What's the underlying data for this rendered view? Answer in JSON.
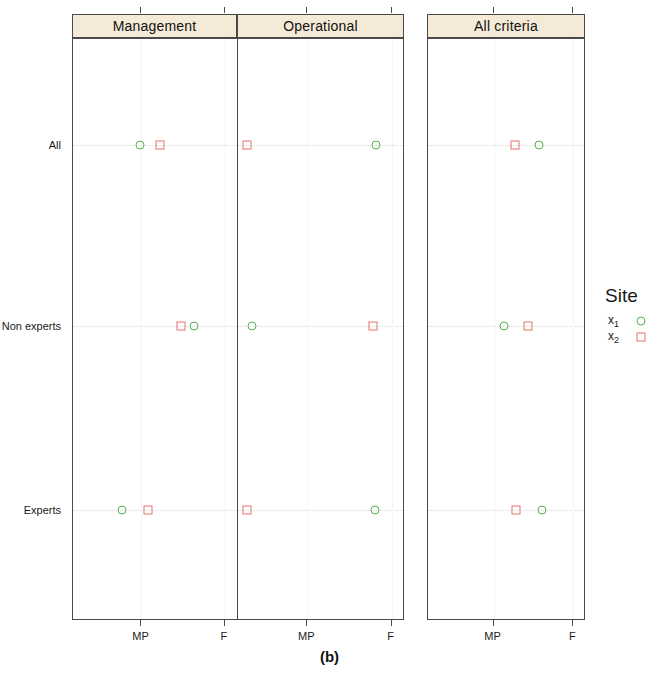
{
  "figure": {
    "caption": "(b)",
    "background": "#ffffff",
    "strip_fill": "#f5ead8",
    "frame_color": "#4a4a4a"
  },
  "legend": {
    "title": "Site",
    "position": "right",
    "entries": [
      {
        "label": "x",
        "sub": "1",
        "marker": "circle",
        "color": "#56b356"
      },
      {
        "label": "x",
        "sub": "2",
        "marker": "square",
        "color": "#e8726a"
      }
    ]
  },
  "chart_data": {
    "type": "scatter",
    "title": "(b)",
    "xlabel": "",
    "ylabel": "",
    "grid": true,
    "legend_position": "right",
    "legend_title": "Site",
    "facets": [
      "Management",
      "Operational",
      "All criteria"
    ],
    "categories": [
      "All",
      "Non experts",
      "Experts"
    ],
    "xticks": [
      "MP",
      "F"
    ],
    "xtick_values": [
      1,
      2
    ],
    "xlim": [
      0.5,
      2.5
    ],
    "series": [
      {
        "name": "x1",
        "marker": "circle",
        "color": "#56b356",
        "points": [
          {
            "facet": "Management",
            "category": "All",
            "x": 1.32
          },
          {
            "facet": "Management",
            "category": "Non experts",
            "x": 1.98
          },
          {
            "facet": "Management",
            "category": "Experts",
            "x": 1.1
          },
          {
            "facet": "Operational",
            "category": "All",
            "x": 2.17
          },
          {
            "facet": "Operational",
            "category": "Non experts",
            "x": 0.68
          },
          {
            "facet": "Operational",
            "category": "Experts",
            "x": 2.15
          },
          {
            "facet": "All criteria",
            "category": "All",
            "x": 1.92
          },
          {
            "facet": "All criteria",
            "category": "Non experts",
            "x": 1.48
          },
          {
            "facet": "All criteria",
            "category": "Experts",
            "x": 1.95
          }
        ]
      },
      {
        "name": "x2",
        "marker": "square",
        "color": "#e8726a",
        "points": [
          {
            "facet": "Management",
            "category": "All",
            "x": 1.57
          },
          {
            "facet": "Management",
            "category": "Non experts",
            "x": 1.82
          },
          {
            "facet": "Management",
            "category": "Experts",
            "x": 1.42
          },
          {
            "facet": "Operational",
            "category": "All",
            "x": 0.62
          },
          {
            "facet": "Operational",
            "category": "Non experts",
            "x": 2.13
          },
          {
            "facet": "Operational",
            "category": "Experts",
            "x": 0.62
          },
          {
            "facet": "All criteria",
            "category": "All",
            "x": 1.61
          },
          {
            "facet": "All criteria",
            "category": "Non experts",
            "x": 1.78
          },
          {
            "facet": "All criteria",
            "category": "Experts",
            "x": 1.63
          }
        ]
      }
    ]
  },
  "geometry": {
    "strip_top": 14,
    "strip_height": 24,
    "body_top": 38,
    "body_bottom": 620,
    "panels": [
      {
        "name": "Management",
        "left": 72,
        "right": 237
      },
      {
        "name": "Operational",
        "left": 237,
        "right": 404
      },
      {
        "name": "All criteria",
        "left": 427,
        "right": 585
      }
    ],
    "rows": [
      {
        "name": "All",
        "y": 145
      },
      {
        "name": "Non experts",
        "y": 326
      },
      {
        "name": "Experts",
        "y": 510
      }
    ],
    "tick_fracs": [
      0.415,
      0.92
    ]
  }
}
